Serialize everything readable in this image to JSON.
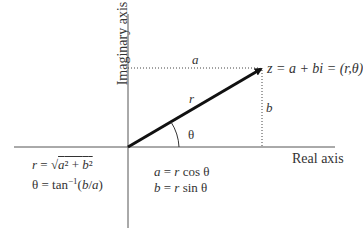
{
  "diagram": {
    "type": "complex-plane",
    "axes": {
      "vertical_label": "Imaginary axis",
      "horizontal_label": "Real axis"
    },
    "point_label": "z = a + bi = (r,θ)",
    "vector_label": "r",
    "angle_label": "θ",
    "horizontal_projection_label": "a",
    "vertical_projection_label": "b",
    "formulas_left": {
      "line1": "r = √(a² + b²)",
      "line2": "θ = tan⁻¹(b/a)"
    },
    "formulas_right": {
      "line1": "a = r cos θ",
      "line2": "b = r sin θ"
    },
    "colors": {
      "lines": "#333333",
      "vector": "#111111",
      "background": "#ffffff"
    }
  }
}
